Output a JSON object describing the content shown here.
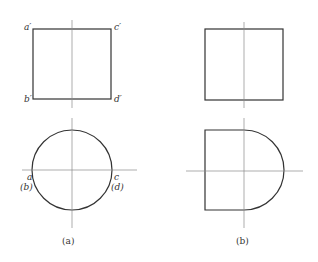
{
  "figure_a": {
    "caption": "(a)",
    "front_view_labels": {
      "top_left": "a′",
      "top_right": "c′",
      "bottom_left": "b′",
      "bottom_right": "d′"
    },
    "top_view_labels": {
      "left_top": "a",
      "left_bottom": "(b)",
      "right_top": "c",
      "right_bottom": "(d)"
    }
  },
  "figure_b": {
    "caption": "(b)"
  }
}
